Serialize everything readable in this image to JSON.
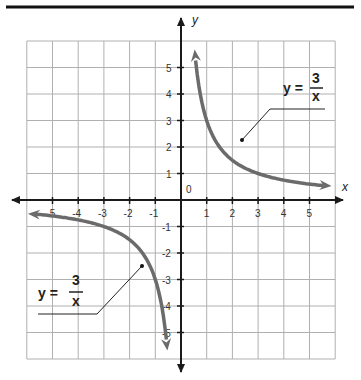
{
  "chart_data": {
    "type": "line",
    "title": "",
    "xlabel": "x",
    "ylabel": "y",
    "xlim": [
      -6,
      6
    ],
    "ylim": [
      -6,
      6
    ],
    "grid": true,
    "x_ticks": [
      -5,
      -4,
      -3,
      -2,
      -1,
      1,
      2,
      3,
      4,
      5
    ],
    "y_ticks": [
      -5,
      -4,
      -3,
      -2,
      -1,
      1,
      2,
      3,
      4,
      5
    ],
    "x_tick_labels": [
      "-5",
      "-4",
      "-3",
      "-2",
      "-1",
      "1",
      "2",
      "3",
      "4",
      "5"
    ],
    "y_tick_labels": [
      "-5",
      "-4",
      "-3",
      "-2",
      "-1",
      "1",
      "2",
      "3",
      "4",
      "5"
    ],
    "origin_label": "0",
    "series": [
      {
        "name": "y = 3/x (first quadrant)",
        "function": "y = 3/x",
        "x": [
          0.55,
          0.6,
          0.75,
          1,
          1.5,
          2,
          2.5,
          3,
          4,
          5,
          5.7
        ],
        "y": [
          5.45,
          5,
          4,
          3,
          2,
          1.5,
          1.2,
          1,
          0.75,
          0.6,
          0.53
        ]
      },
      {
        "name": "y = 3/x (third quadrant)",
        "function": "y = 3/x",
        "x": [
          -5.8,
          -5,
          -4,
          -3,
          -2.5,
          -2,
          -1.5,
          -1,
          -0.75,
          -0.6,
          -0.55
        ],
        "y": [
          -0.52,
          -0.6,
          -0.75,
          -1,
          -1.2,
          -1.5,
          -2,
          -3,
          -4,
          -5,
          -5.45
        ]
      }
    ],
    "annotations": [
      {
        "text": "y = 3/x",
        "numerator": "3",
        "denominator": "x",
        "lhs": "y =",
        "points_to": [
          2.3,
          2.3
        ]
      },
      {
        "text": "y = 3/x",
        "numerator": "3",
        "denominator": "x",
        "lhs": "y =",
        "points_to": [
          -1.5,
          -2.5
        ]
      }
    ]
  },
  "labels": {
    "x_axis": "x",
    "y_axis": "y",
    "origin": "0",
    "eq_lhs": "y =",
    "eq_num": "3",
    "eq_den": "x"
  },
  "colors": {
    "curve": "#6b6b6b",
    "axis": "#1a1a1a",
    "grid": "#b0b0b0",
    "rule": "#111111"
  }
}
